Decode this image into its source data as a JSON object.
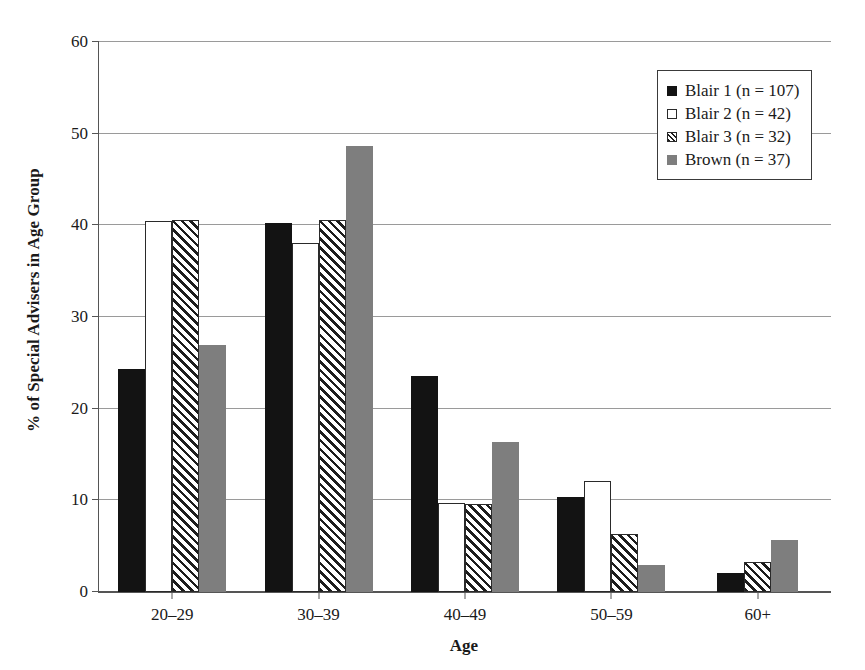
{
  "chart_data": {
    "type": "bar",
    "title": "",
    "xlabel": "Age",
    "ylabel": "% of Special Advisers in Age Group",
    "categories": [
      "20–29",
      "30–39",
      "40–49",
      "50–59",
      "60+"
    ],
    "series": [
      {
        "name": "Blair 1 (n = 107)",
        "n": 107,
        "swatch": "black-filled",
        "values": [
          24.3,
          40.3,
          23.6,
          10.4,
          2.1
        ]
      },
      {
        "name": "Blair 2 (n = 42)",
        "n": 42,
        "swatch": "white-outline",
        "values": [
          40.5,
          38.1,
          9.7,
          12.1,
          0
        ]
      },
      {
        "name": "Blair 3 (n = 32)",
        "n": 32,
        "swatch": "diagonal-hatch",
        "values": [
          40.6,
          40.6,
          9.6,
          6.3,
          3.3
        ]
      },
      {
        "name": "Brown (n = 37)",
        "n": 37,
        "swatch": "gray-filled",
        "values": [
          27.0,
          48.7,
          16.4,
          2.9,
          5.7
        ]
      }
    ],
    "ylim": [
      0,
      60
    ],
    "yticks": [
      0,
      10,
      20,
      30,
      40,
      50,
      60
    ],
    "ytick_labels": [
      "0",
      "10",
      "20",
      "30",
      "40",
      "50",
      "60"
    ],
    "grid": true,
    "legend_position": "top-right",
    "colors": {
      "series_black": "#131313",
      "series_white": "#ffffff",
      "series_hatch": "#1d1d1d",
      "series_gray": "#7e7e7e",
      "axis": "#555555",
      "gridline": "#9a9a9a",
      "background": "#ffffff"
    }
  }
}
